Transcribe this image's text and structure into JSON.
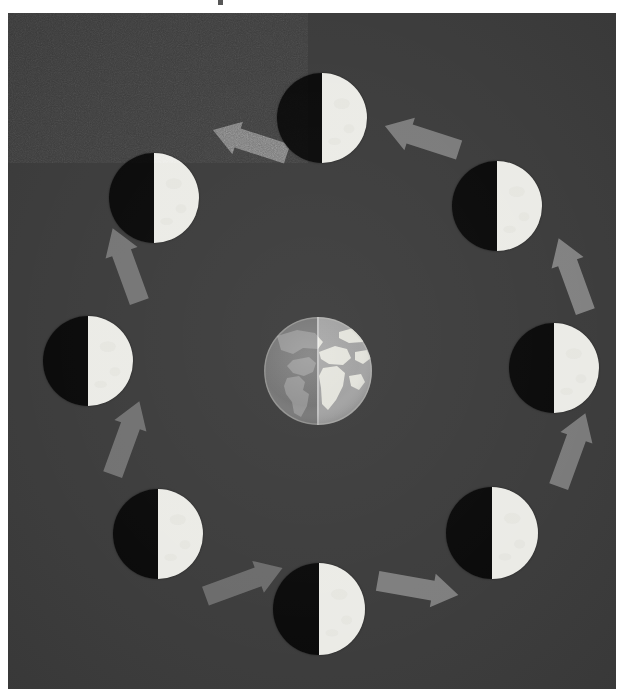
{
  "figure": {
    "background_color": "#3a3a3a",
    "page_color": "#ffffff",
    "width": 608,
    "height": 676,
    "orbit_direction": "counterclockwise"
  },
  "earth": {
    "label": "Earth",
    "center_x": 310,
    "center_y": 358,
    "radius": 55,
    "night_side": "left",
    "day_side": "right",
    "ocean_night_color": "#6e6e6e",
    "ocean_day_color": "#9a9a9a",
    "land_night_color": "#8c8c8c",
    "land_day_color": "#dcdcd4"
  },
  "moons": [
    {
      "name": "moon-top",
      "label": "Moon at top position",
      "cx": 314,
      "cy": 105,
      "r": 45,
      "dark_side": "left",
      "lit_side": "right"
    },
    {
      "name": "moon-top-left",
      "label": "Moon at upper-left position",
      "cx": 146,
      "cy": 185,
      "r": 45,
      "dark_side": "left",
      "lit_side": "right"
    },
    {
      "name": "moon-left",
      "label": "Moon at left position",
      "cx": 80,
      "cy": 348,
      "r": 45,
      "dark_side": "left",
      "lit_side": "right"
    },
    {
      "name": "moon-bottom-left",
      "label": "Moon at lower-left position",
      "cx": 150,
      "cy": 521,
      "r": 45,
      "dark_side": "left",
      "lit_side": "right"
    },
    {
      "name": "moon-bottom",
      "label": "Moon at bottom position",
      "cx": 311,
      "cy": 596,
      "r": 46,
      "dark_side": "left",
      "lit_side": "right"
    },
    {
      "name": "moon-bottom-right",
      "label": "Moon at lower-right position",
      "cx": 484,
      "cy": 520,
      "r": 46,
      "dark_side": "left",
      "lit_side": "right"
    },
    {
      "name": "moon-right",
      "label": "Moon at right position",
      "cx": 546,
      "cy": 355,
      "r": 45,
      "dark_side": "left",
      "lit_side": "right"
    },
    {
      "name": "moon-top-right",
      "label": "Moon at upper-right position",
      "cx": 489,
      "cy": 193,
      "r": 45,
      "dark_side": "left",
      "lit_side": "right"
    }
  ],
  "arrows": [
    {
      "name": "arrow-top-right-to-top",
      "label": "Arrow from upper-right moon to top moon",
      "x": 375,
      "y": 108,
      "rotation": 198,
      "length": 78,
      "color": "#808080"
    },
    {
      "name": "arrow-top-to-top-left",
      "label": "Arrow from top moon to upper-left moon",
      "x": 203,
      "y": 112,
      "rotation": 198,
      "length": 78,
      "color": "#7d7d7d"
    },
    {
      "name": "arrow-top-left-to-left",
      "label": "Arrow from upper-left moon to left moon",
      "x": 79,
      "y": 235,
      "rotation": 250,
      "length": 78,
      "color": "#7a7a7a"
    },
    {
      "name": "arrow-left-to-bottom-left",
      "label": "Arrow from left moon to lower-left moon",
      "x": 79,
      "y": 408,
      "rotation": 290,
      "length": 78,
      "color": "#757575"
    },
    {
      "name": "arrow-bottom-left-to-bottom",
      "label": "Arrow from lower-left moon to bottom moon",
      "x": 195,
      "y": 552,
      "rotation": 340,
      "length": 82,
      "color": "#6f6f6f"
    },
    {
      "name": "arrow-bottom-to-bottom-right",
      "label": "Arrow from bottom moon to lower-right moon",
      "x": 369,
      "y": 558,
      "rotation": 10,
      "length": 82,
      "color": "#838383"
    },
    {
      "name": "arrow-bottom-right-to-right",
      "label": "Arrow from lower-right moon to right moon",
      "x": 525,
      "y": 420,
      "rotation": 290,
      "length": 78,
      "color": "#7f7f7f"
    },
    {
      "name": "arrow-right-to-top-right",
      "label": "Arrow from right moon to upper-right moon",
      "x": 525,
      "y": 245,
      "rotation": 250,
      "length": 78,
      "color": "#878787"
    }
  ]
}
